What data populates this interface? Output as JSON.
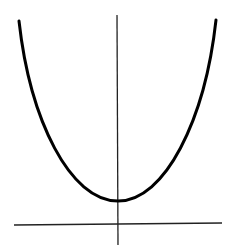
{
  "figure": {
    "background_color": "#ffffff",
    "axis_color": "#222222",
    "curve_color": "#000000"
  },
  "axes": {
    "x_axis": {
      "x1": 14,
      "y1": 225,
      "x2": 222,
      "y2": 223
    },
    "y_axis": {
      "x1": 117,
      "y1": 15,
      "x2": 118,
      "y2": 245
    }
  },
  "curve": {
    "left_top": {
      "x": 19,
      "y": 21
    },
    "vertex": {
      "x": 118,
      "y": 201
    },
    "right_top": {
      "x": 216,
      "y": 20
    },
    "path": "M19,21 C30,120 70,201 118,201 C165,201 205,120 216,20"
  }
}
